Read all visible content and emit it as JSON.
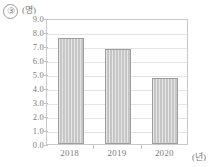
{
  "item_marker": "③",
  "chart_data": {
    "type": "bar",
    "title": "",
    "xlabel": "(년)",
    "ylabel": "(명)",
    "categories": [
      "2018",
      "2019",
      "2020"
    ],
    "values": [
      7.6,
      6.8,
      4.7
    ],
    "ylim": [
      0.0,
      9.0
    ],
    "ytick_labels": [
      "9.0",
      "8.0",
      "7.0",
      "6.0",
      "5.0",
      "4.0",
      "3.0",
      "2.0",
      "1.0",
      "0.0"
    ],
    "ytick_values": [
      9.0,
      8.0,
      7.0,
      6.0,
      5.0,
      4.0,
      3.0,
      2.0,
      1.0,
      0.0
    ],
    "grid": true,
    "legend": false,
    "bar_color": "#c6c6c6",
    "bar_border_color": "#9e9e9e",
    "grid_color": "#e4e4e4",
    "frame_color": "#c9c9c9",
    "text_color": "#7d7d7d"
  }
}
